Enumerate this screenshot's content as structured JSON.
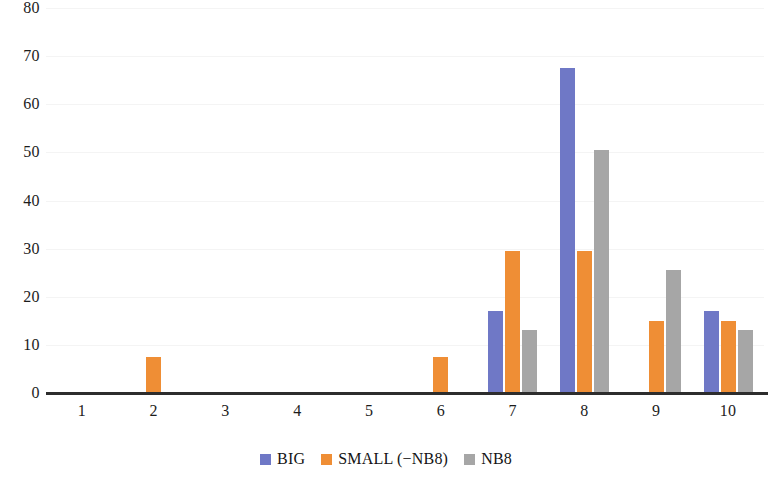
{
  "chart_data": {
    "type": "bar",
    "title": "",
    "xlabel": "",
    "ylabel": "",
    "grid": true,
    "legend_position": "bottom",
    "ylim": [
      0,
      80
    ],
    "yticks": [
      "0",
      "10",
      "20",
      "30",
      "40",
      "50",
      "60",
      "70",
      "80"
    ],
    "ytick_values": [
      0,
      10,
      20,
      30,
      40,
      50,
      60,
      70,
      80
    ],
    "categories": [
      "1",
      "2",
      "3",
      "4",
      "5",
      "6",
      "7",
      "8",
      "9",
      "10"
    ],
    "series": [
      {
        "name": "BIG",
        "color": "#6f78c6",
        "values": [
          0,
          0,
          0,
          0,
          0,
          0,
          17,
          67.5,
          0,
          17
        ]
      },
      {
        "name": "SMALL (−NB8)",
        "color": "#ef8e35",
        "values": [
          0,
          7.5,
          0,
          0,
          0,
          7.5,
          29.5,
          29.5,
          15,
          15
        ]
      },
      {
        "name": "NB8",
        "color": "#a6a6a6",
        "values": [
          0,
          0,
          0,
          0,
          0,
          0,
          13,
          50.5,
          25.5,
          13
        ]
      }
    ]
  },
  "legend": {
    "entries": [
      {
        "label": "BIG",
        "color": "#6f78c6"
      },
      {
        "label": "SMALL (−NB8)",
        "color": "#ef8e35"
      },
      {
        "label": "NB8",
        "color": "#a6a6a6"
      }
    ]
  },
  "axes": {
    "y_tick_labels": [
      "80",
      "70",
      "60",
      "50",
      "40",
      "30",
      "20",
      "10",
      "0"
    ],
    "x_tick_labels": [
      "1",
      "2",
      "3",
      "4",
      "5",
      "6",
      "7",
      "8",
      "9",
      "10"
    ]
  }
}
